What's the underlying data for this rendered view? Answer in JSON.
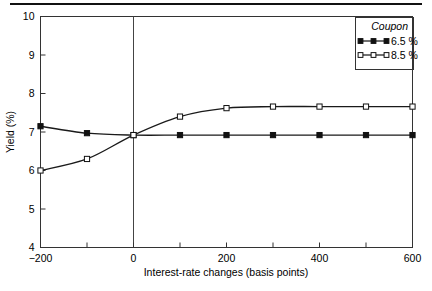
{
  "figure": {
    "background": "#ffffff",
    "frame_color": "#333333",
    "line_color": "#1a1a1a"
  },
  "chart_data": {
    "type": "line",
    "title": "",
    "xlabel": "Interest-rate changes (basis points)",
    "ylabel": "Yield (%)",
    "xlim": [
      -200,
      600
    ],
    "ylim": [
      4,
      10
    ],
    "xticks": [
      -200,
      -100,
      0,
      100,
      200,
      300,
      400,
      500,
      600
    ],
    "xticklabels": [
      "−200",
      "",
      "0",
      "",
      "200",
      "",
      "400",
      "",
      "600"
    ],
    "yticks": [
      4,
      5,
      6,
      7,
      8,
      9,
      10
    ],
    "yticklabels": [
      "4",
      "5",
      "6",
      "7",
      "8",
      "9",
      "10"
    ],
    "grid": false,
    "zero_line": 0,
    "legend_title": "Coupon",
    "legend_position": "top-right",
    "x": [
      -200,
      -100,
      0,
      100,
      200,
      300,
      400,
      500,
      600
    ],
    "series": [
      {
        "name": "6.5 %",
        "marker": "filled-square",
        "values": [
          7.15,
          6.97,
          6.92,
          6.92,
          6.92,
          6.92,
          6.92,
          6.92,
          6.92
        ]
      },
      {
        "name": "8.5 %",
        "marker": "open-square",
        "values": [
          6.0,
          6.3,
          6.92,
          7.4,
          7.62,
          7.66,
          7.66,
          7.66,
          7.66
        ]
      }
    ]
  },
  "legend": {
    "header": "Coupon",
    "entries": [
      {
        "label": "6.5 %",
        "marker": "filled-square"
      },
      {
        "label": "8.5 %",
        "marker": "open-square"
      }
    ]
  }
}
